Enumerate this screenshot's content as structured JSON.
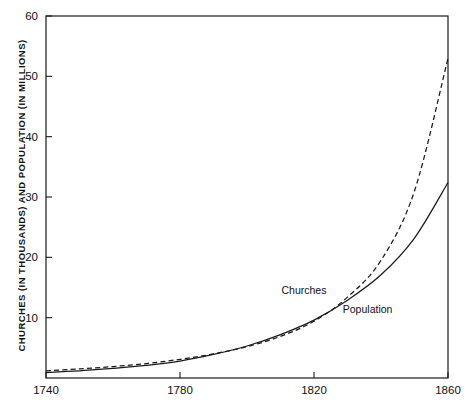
{
  "chart_data": {
    "type": "line",
    "title": "",
    "xlabel": "",
    "ylabel": "CHURCHES (IN THOUSANDS) AND POPULATION (IN MILLIONS)",
    "xlim": [
      1740,
      1860
    ],
    "ylim": [
      0,
      60
    ],
    "grid": false,
    "legend_position": "inline-annotation",
    "x_ticks": [
      1740,
      1780,
      1820,
      1860
    ],
    "x_tick_labels": [
      "1740",
      "1780",
      "1820",
      "1860"
    ],
    "y_ticks": [
      10,
      20,
      30,
      40,
      50,
      60
    ],
    "y_tick_labels": [
      "10",
      "20",
      "30",
      "40",
      "50",
      "60"
    ],
    "series": [
      {
        "name": "Churches",
        "style": "dashed",
        "color": "#1a1a1a",
        "annotation": "Churches",
        "annotation_x": 1817,
        "annotation_y": 14.6,
        "x": [
          1740,
          1750,
          1760,
          1770,
          1780,
          1790,
          1800,
          1810,
          1820,
          1830,
          1840,
          1850,
          1860
        ],
        "values": [
          1.2,
          1.5,
          1.9,
          2.4,
          3.1,
          4.0,
          5.2,
          6.9,
          9.4,
          13.4,
          19.5,
          31.0,
          53.0
        ]
      },
      {
        "name": "Population",
        "style": "solid",
        "color": "#1a1a1a",
        "annotation": "Population",
        "annotation_x": 1836,
        "annotation_y": 11.5,
        "x": [
          1740,
          1750,
          1760,
          1770,
          1780,
          1790,
          1800,
          1810,
          1820,
          1830,
          1840,
          1850,
          1860
        ],
        "values": [
          0.9,
          1.2,
          1.6,
          2.1,
          2.8,
          3.9,
          5.3,
          7.2,
          9.6,
          12.9,
          17.1,
          23.2,
          32.4
        ]
      }
    ]
  }
}
